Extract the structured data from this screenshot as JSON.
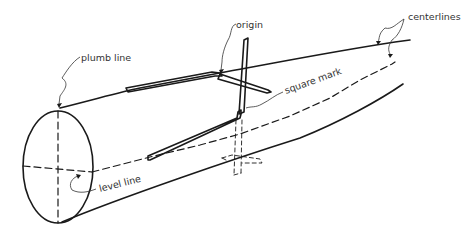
{
  "diagram": {
    "labels": {
      "plumb_line": "plumb line",
      "origin": "origin",
      "centerlines": "centerlines",
      "square_mark": "square mark",
      "level_line": "level line"
    },
    "colors": {
      "ink": "#1a1a1a",
      "label": "#333333",
      "background": "#ffffff"
    }
  }
}
